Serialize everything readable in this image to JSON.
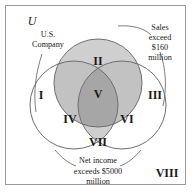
{
  "diagram": {
    "type": "venn",
    "universe_label": "U",
    "frame": {
      "border_color": "#9a9a9a"
    },
    "colors": {
      "background": "#ffffff",
      "outline": "#6e6e6e",
      "text": "#1a1a1a",
      "shade_light": "#cfcfcf",
      "shade_medium": "#c2c2c2",
      "shade_dark": "#a6a6a6"
    },
    "sets": [
      {
        "id": "us-company",
        "label_lines": [
          "U.S.",
          "Company"
        ],
        "position": "left"
      },
      {
        "id": "sales",
        "label_lines": [
          "Sales",
          "exceed",
          "$160",
          "million"
        ],
        "position": "top-right"
      },
      {
        "id": "net-income",
        "label_lines": [
          "Net income",
          "exceeds $5000",
          "million"
        ],
        "position": "bottom"
      }
    ],
    "regions": [
      {
        "id": "region-1",
        "label": "I",
        "shade": "none"
      },
      {
        "id": "region-2",
        "label": "II",
        "shade": "light"
      },
      {
        "id": "region-3",
        "label": "III",
        "shade": "none"
      },
      {
        "id": "region-4",
        "label": "IV",
        "shade": "light"
      },
      {
        "id": "region-5",
        "label": "V",
        "shade": "dark"
      },
      {
        "id": "region-6",
        "label": "VI",
        "shade": "light"
      },
      {
        "id": "region-7",
        "label": "VII",
        "shade": "light"
      },
      {
        "id": "region-8",
        "label": "VIII",
        "shade": "none"
      }
    ]
  }
}
